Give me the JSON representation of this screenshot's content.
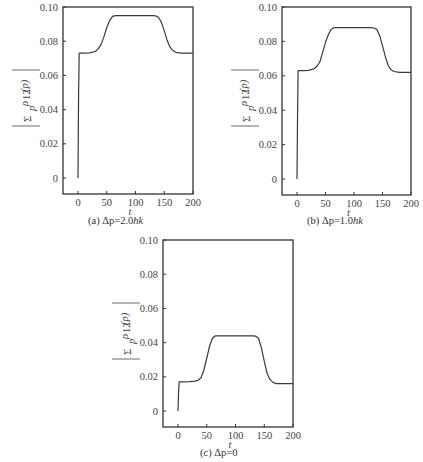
{
  "chart_data": [
    {
      "type": "line",
      "panel": "a",
      "caption": "(a) Δp=2.0ħk",
      "caption_prefix": "(a)",
      "caption_text": "Δp=2.0hk",
      "title": "",
      "xlabel": "t",
      "ylabel": "|Σ_p ρ12(p)|",
      "xlim": [
        -25,
        200
      ],
      "ylim": [
        -0.01,
        0.1
      ],
      "xticks": [
        0,
        50,
        100,
        150,
        200
      ],
      "yticks": [
        "0",
        "0.02",
        "0.04",
        "0.06",
        "0.08",
        "0.10"
      ],
      "grid": false,
      "series": [
        {
          "name": "|Σρ12(p)|",
          "x": [
            0,
            1,
            2,
            10,
            20,
            30,
            35,
            40,
            45,
            50,
            55,
            60,
            65,
            70,
            100,
            130,
            135,
            140,
            145,
            150,
            155,
            160,
            165,
            170,
            180,
            200
          ],
          "y": [
            0,
            0.05,
            0.073,
            0.073,
            0.0732,
            0.074,
            0.0755,
            0.078,
            0.0825,
            0.088,
            0.092,
            0.0945,
            0.095,
            0.095,
            0.095,
            0.095,
            0.0948,
            0.094,
            0.091,
            0.086,
            0.0805,
            0.0765,
            0.0745,
            0.0735,
            0.073,
            0.073
          ]
        }
      ]
    },
    {
      "type": "line",
      "panel": "b",
      "caption": "(b) Δp=1.0ħk",
      "caption_prefix": "(b)",
      "caption_text": "Δp=1.0hk",
      "title": "",
      "xlabel": "t",
      "ylabel": "|Σ_p ρ12(p)|",
      "xlim": [
        -25,
        200
      ],
      "ylim": [
        -0.01,
        0.1
      ],
      "xticks": [
        0,
        50,
        100,
        150,
        200
      ],
      "yticks": [
        "0",
        "0.02",
        "0.04",
        "0.06",
        "0.08",
        "0.10"
      ],
      "grid": false,
      "series": [
        {
          "name": "|Σρ12(p)|",
          "x": [
            0,
            1,
            2,
            10,
            20,
            30,
            35,
            40,
            45,
            50,
            55,
            60,
            65,
            70,
            100,
            130,
            135,
            140,
            145,
            150,
            155,
            160,
            165,
            170,
            180,
            200
          ],
          "y": [
            0,
            0.04,
            0.063,
            0.063,
            0.0632,
            0.064,
            0.0655,
            0.068,
            0.0735,
            0.0795,
            0.084,
            0.087,
            0.088,
            0.088,
            0.088,
            0.088,
            0.0878,
            0.087,
            0.0835,
            0.0775,
            0.071,
            0.066,
            0.0635,
            0.0625,
            0.062,
            0.062
          ]
        }
      ]
    },
    {
      "type": "line",
      "panel": "c",
      "caption": "(c) Δp=0",
      "caption_prefix": "(c)",
      "caption_text": "Δp=0",
      "title": "",
      "xlabel": "t",
      "ylabel": "|Σ_p ρ12(p)|",
      "xlim": [
        -25,
        200
      ],
      "ylim": [
        -0.01,
        0.1
      ],
      "xticks": [
        0,
        50,
        100,
        150,
        200
      ],
      "yticks": [
        "0",
        "0.02",
        "0.04",
        "0.06",
        "0.08",
        "0.10"
      ],
      "grid": false,
      "series": [
        {
          "name": "|Σρ12(p)|",
          "x": [
            0,
            1,
            2,
            10,
            20,
            30,
            35,
            40,
            45,
            50,
            55,
            60,
            65,
            70,
            100,
            130,
            135,
            140,
            145,
            150,
            155,
            160,
            165,
            170,
            180,
            200
          ],
          "y": [
            0,
            0.012,
            0.017,
            0.017,
            0.0172,
            0.0175,
            0.018,
            0.0195,
            0.024,
            0.031,
            0.038,
            0.0425,
            0.044,
            0.044,
            0.044,
            0.044,
            0.0438,
            0.0425,
            0.037,
            0.029,
            0.022,
            0.0185,
            0.0168,
            0.016,
            0.016,
            0.016
          ]
        }
      ]
    }
  ],
  "panels": [
    {
      "id": "a",
      "caption_prefix": "(a)",
      "caption_main": "Δp=2.0",
      "caption_unit": "hk",
      "xlabel": "t"
    },
    {
      "id": "b",
      "caption_prefix": "(b)",
      "caption_main": "Δp=1.0",
      "caption_unit": "hk",
      "xlabel": "t"
    },
    {
      "id": "c",
      "caption_prefix": "(c)",
      "caption_main": "Δp=0",
      "caption_unit": "",
      "xlabel": "t"
    }
  ],
  "axis": {
    "xticks": [
      "0",
      "50",
      "100",
      "150",
      "200"
    ],
    "yticks": [
      "0",
      "0.02",
      "0.04",
      "0.06",
      "0.08",
      "0.10"
    ],
    "ylabel_sum": "Σ",
    "ylabel_sub": "p",
    "ylabel_rho": "ρ",
    "ylabel_rho_sub": "12",
    "ylabel_arg": "(p)"
  },
  "colors": {
    "line": "#3a3a3a",
    "frame": "#333333",
    "text": "#444444",
    "background": "#ffffff"
  }
}
